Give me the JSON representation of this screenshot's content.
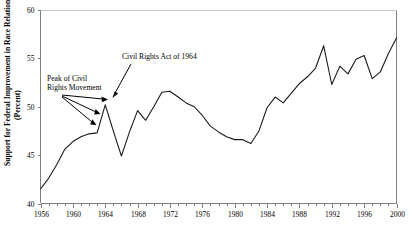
{
  "chart_data": {
    "type": "line",
    "title": "",
    "xlabel": "",
    "ylabel": "Support for Federal Improvement in Race Relations",
    "ylabel_units": "(Percent)",
    "xlim": [
      1956,
      2000
    ],
    "ylim": [
      40,
      60
    ],
    "grid": false,
    "legend": "none",
    "line_color": "#1a1a1a",
    "axis_color": "#808080",
    "x_tick_labels": [
      "1956",
      "1960",
      "1964",
      "1968",
      "1972",
      "1976",
      "1980",
      "1984",
      "1988",
      "1992",
      "1996",
      "2000"
    ],
    "x_tick_values": [
      1956,
      1960,
      1964,
      1968,
      1972,
      1976,
      1980,
      1984,
      1988,
      1992,
      1996,
      2000
    ],
    "x_minor_tick_step": 1,
    "y_tick_labels": [
      "40",
      "45",
      "50",
      "55",
      "60"
    ],
    "y_tick_values": [
      40,
      45,
      50,
      55,
      60
    ],
    "series": [
      {
        "name": "Support for Federal Improvement in Race Relations",
        "x": [
          1956,
          1957,
          1958,
          1959,
          1960,
          1961,
          1962,
          1963,
          1964,
          1965,
          1966,
          1967,
          1968,
          1969,
          1970,
          1971,
          1972,
          1973,
          1974,
          1975,
          1976,
          1977,
          1978,
          1979,
          1980,
          1981,
          1982,
          1983,
          1984,
          1985,
          1986,
          1987,
          1988,
          1989,
          1990,
          1991,
          1992,
          1993,
          1994,
          1995,
          1996,
          1997,
          1998,
          1999,
          2000
        ],
        "values": [
          41.5,
          42.6,
          44.0,
          45.6,
          46.4,
          46.9,
          47.2,
          47.3,
          50.2,
          47.5,
          44.9,
          47.4,
          49.6,
          48.6,
          50.0,
          51.5,
          51.6,
          51.0,
          50.4,
          50.0,
          49.1,
          48.0,
          47.4,
          46.9,
          46.6,
          46.6,
          46.2,
          47.5,
          49.9,
          51.0,
          50.4,
          51.4,
          52.4,
          53.1,
          54.0,
          56.3,
          52.3,
          54.2,
          53.4,
          54.9,
          55.3,
          52.9,
          53.6,
          55.5,
          57.1
        ]
      }
    ],
    "annotations": [
      {
        "text": "Civil Rights Act of 1964",
        "points_to_year": 1964,
        "points_to_value": 50.2
      },
      {
        "text_line_1": "Peak of Civil",
        "text_line_2": "Rights Movement",
        "points_to_years": [
          1964,
          1963,
          1962
        ],
        "arrow_count": 3
      }
    ]
  },
  "figure": {
    "width": 411,
    "height": 232
  }
}
